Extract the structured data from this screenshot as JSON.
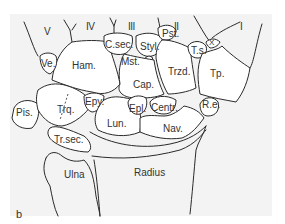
{
  "figure": {
    "panel_label": "b",
    "metacarpals": [
      "V",
      "IV",
      "III",
      "II",
      "I"
    ],
    "bones": {
      "ham": "Ham.",
      "ve": "Ve.",
      "csec": "C.sec.",
      "styl": "Styl.",
      "pst": "Pst.",
      "ts": "T.s.",
      "x": "X",
      "mst": "Mst.",
      "cap": "Cap.",
      "trzd": "Trzd.",
      "tp": "Tp.",
      "pis": "Pis.",
      "trq": "Trq.",
      "epy": "Epy.",
      "epl": "Epl.",
      "centr": "Centr.",
      "re": "R.e.",
      "lun": "Lun.",
      "nav": "Nav.",
      "trsec": "Tr.sec.",
      "ulna": "Ulna",
      "radius": "Radius"
    }
  },
  "colors": {
    "background": "#f3f3f3",
    "bone_fill": "#ffffff",
    "outline": "#2a2a2a",
    "text": "#333333"
  }
}
